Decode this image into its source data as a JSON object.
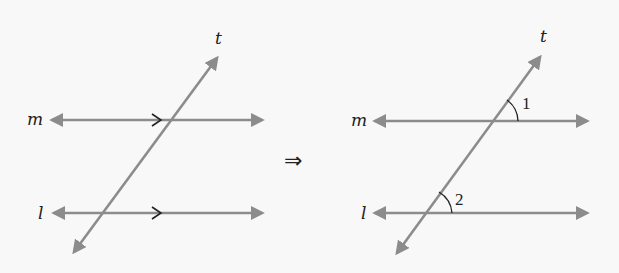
{
  "colors": {
    "background": "#f8f8f8",
    "line": "#8c8c8c",
    "text": "#222222"
  },
  "left_diagram": {
    "labels": {
      "transversal": "t",
      "line_top": "m",
      "line_bottom": "l"
    },
    "parallel_marks": [
      ">",
      ">"
    ]
  },
  "implies_symbol": "⇒",
  "right_diagram": {
    "labels": {
      "transversal": "t",
      "line_top": "m",
      "line_bottom": "l"
    },
    "angles": [
      {
        "label": "1",
        "position": "above line m, right of transversal"
      },
      {
        "label": "2",
        "position": "above line l, right of transversal"
      }
    ]
  }
}
